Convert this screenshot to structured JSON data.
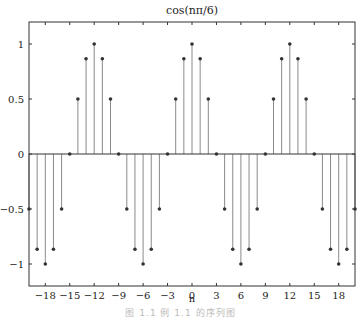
{
  "chart_data": {
    "type": "stem",
    "title": "cos(nπ/6)",
    "xlabel": "n",
    "ylabel": "",
    "xlim": [
      -20,
      20
    ],
    "ylim": [
      -1.2,
      1.2
    ],
    "grid": false,
    "legend": null,
    "x_ticks": [
      -18,
      -15,
      -12,
      -9,
      -6,
      -3,
      0,
      3,
      6,
      9,
      12,
      15,
      18
    ],
    "x_tick_labels": [
      "−18",
      "−15",
      "−12",
      "−9",
      "−6",
      "−3",
      "0",
      "3",
      "6",
      "9",
      "12",
      "15",
      "18"
    ],
    "y_ticks": [
      -1,
      -0.5,
      0,
      0.5,
      1
    ],
    "y_tick_labels": [
      "−1",
      "−0.5",
      "0",
      "0.5",
      "1"
    ],
    "x": [
      -20,
      -19,
      -18,
      -17,
      -16,
      -15,
      -14,
      -13,
      -12,
      -11,
      -10,
      -9,
      -8,
      -7,
      -6,
      -5,
      -4,
      -3,
      -2,
      -1,
      0,
      1,
      2,
      3,
      4,
      5,
      6,
      7,
      8,
      9,
      10,
      11,
      12,
      13,
      14,
      15,
      16,
      17,
      18,
      19,
      20
    ],
    "values": [
      -0.5,
      -0.866,
      -1,
      -0.866,
      -0.5,
      0,
      0.5,
      0.866,
      1,
      0.866,
      0.5,
      0,
      -0.5,
      -0.866,
      -1,
      -0.866,
      -0.5,
      0,
      0.5,
      0.866,
      1,
      0.866,
      0.5,
      0,
      -0.5,
      -0.866,
      -1,
      -0.866,
      -0.5,
      0,
      0.5,
      0.866,
      1,
      0.866,
      0.5,
      0,
      -0.5,
      -0.866,
      -1,
      -0.866,
      -0.5
    ],
    "colors": {
      "stem": "#8a8a8a",
      "marker": "#333333",
      "axis": "#333333",
      "baseline": "#333333"
    }
  },
  "caption": "图 1.1   例 1.1 的序列图"
}
